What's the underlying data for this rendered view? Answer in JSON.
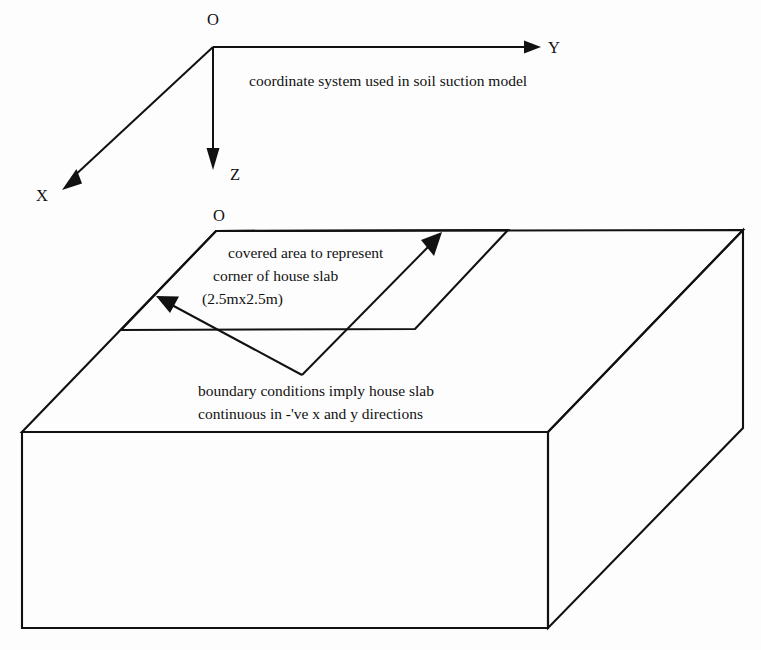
{
  "figure": {
    "background_color": "#fdfdfd",
    "line_color": "#111111"
  },
  "coordinate_system": {
    "origin_label": "O",
    "axes": [
      {
        "name": "x-axis",
        "label": "X",
        "direction": "down-left"
      },
      {
        "name": "y-axis",
        "label": "Y",
        "direction": "right"
      },
      {
        "name": "z-axis",
        "label": "Z",
        "direction": "down"
      }
    ],
    "caption": "coordinate system used in soil suction model"
  },
  "block": {
    "origin_label": "O",
    "slab": {
      "annotation_line_1": "covered area to represent",
      "annotation_line_2": "corner of house slab",
      "annotation_line_3": "(2.5mx2.5m)",
      "dimensions": "2.5m x 2.5m"
    },
    "boundary_note": {
      "line_1": "boundary conditions imply house slab",
      "line_2": "continuous in -'ve x and y directions"
    }
  }
}
